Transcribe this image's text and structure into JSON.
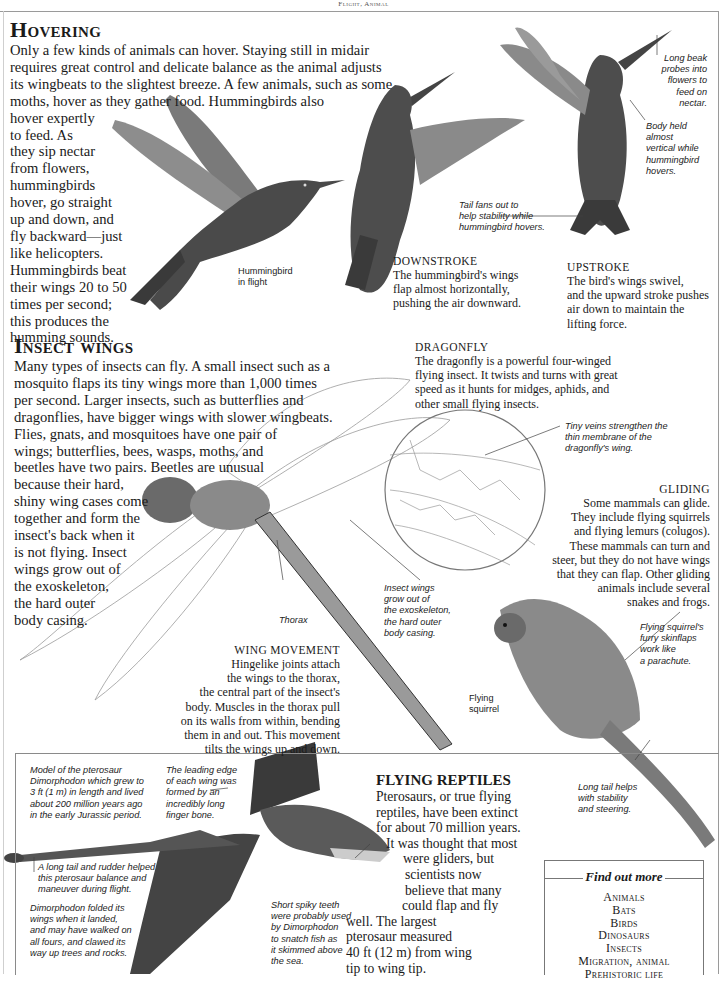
{
  "running_head": "Flight, Animal",
  "hovering": {
    "title": "Hovering",
    "intro_lines": [
      "Only a few kinds of animals can hover. Staying still in midair",
      "requires great control and delicate balance as the animal adjusts",
      "its wingbeats to the slightest breeze. A few animals, such as some",
      "moths, hover as they gather food. Hummingbirds also"
    ],
    "column_lines": [
      "hover expertly",
      "to feed. As",
      "they sip nectar",
      "from flowers,",
      "hummingbirds",
      "hover, go straight",
      "up and down, and",
      "fly backward—just",
      "like helicopters.",
      "Hummingbirds beat",
      "their wings 20 to 50",
      "times per second;",
      "this produces the",
      "humming sounds."
    ],
    "caption_in_flight": [
      "Hummingbird",
      "in flight"
    ],
    "downstroke": {
      "heading": "Downstroke",
      "lines": [
        "The hummingbird's wings",
        "flap almost horizontally,",
        "pushing the air downward."
      ]
    },
    "upstroke": {
      "heading": "Upstroke",
      "lines": [
        "The bird's wings swivel,",
        "and the upward stroke pushes",
        "air down to maintain the",
        "lifting force."
      ]
    },
    "caption_tail": [
      "Tail fans out to",
      "help stability while",
      "hummingbird hovers."
    ],
    "caption_beak": [
      "Long beak",
      "probes into",
      "flowers to",
      "feed on",
      "nectar."
    ],
    "caption_body": [
      "Body held",
      "almost",
      "vertical while",
      "hummingbird",
      "hovers."
    ]
  },
  "insect_wings": {
    "title": "Insect wings",
    "wide_lines": [
      "Many types of insects can fly. A small insect such as a",
      "mosquito flaps its tiny wings more than 1,000 times",
      "per second. Larger insects, such as butterflies and",
      "dragonflies, have bigger wings with slower wingbeats.",
      "Flies, gnats, and mosquitoes have one pair of",
      "wings; butterflies, bees, wasps, moths, and",
      "beetles have two pairs. Beetles are unusual"
    ],
    "narrow_lines": [
      "because their hard,",
      "shiny wing cases come",
      "together and form the",
      "insect's back when it",
      "is not flying. Insect",
      "wings grow out of",
      "the exoskeleton,",
      "the hard outer",
      "body casing."
    ],
    "dragonfly": {
      "heading": "Dragonfly",
      "lines": [
        "The dragonfly is a powerful four-winged",
        "flying insect. It twists and turns with great",
        "speed as it hunts for midges, aphids, and",
        "other small flying insects."
      ]
    },
    "caption_veins": [
      "Tiny veins strengthen the",
      "thin membrane of the",
      "dragonfly's wing."
    ],
    "caption_exoskeleton": [
      "Insect wings",
      "grow out of",
      "the exoskeleton,",
      "the hard outer",
      "body casing."
    ],
    "caption_thorax": "Thorax",
    "wing_movement": {
      "heading": "Wing movement",
      "lines": [
        "Hingelike joints attach",
        "the wings to the thorax,",
        "the central part of the insect's",
        "body. Muscles in the thorax pull",
        "on its walls from within, bending",
        "them in and out. This movement",
        "tilts the wings up and down."
      ]
    }
  },
  "gliding": {
    "heading": "Gliding",
    "lines": [
      "Some mammals can glide.",
      "They include flying squirrels",
      "and flying lemurs (colugos).",
      "These mammals can turn and",
      "steer, but they do not have wings",
      "that they can flap. Other gliding",
      "animals include several",
      "snakes and frogs."
    ],
    "caption_skinflaps": [
      "Flying squirrel's",
      "furry skinflaps",
      "work like",
      "a parachute."
    ],
    "caption_squirrel": [
      "Flying",
      "squirrel"
    ],
    "caption_tail": [
      "Long tail helps",
      "with stability",
      "and steering."
    ]
  },
  "pterosaur": {
    "caption_model": [
      "Model of the pterosaur",
      "Dimorphodon which grew to",
      "3 ft (1 m) in length and lived",
      "about 200 million years ago",
      "in the early Jurassic period."
    ],
    "caption_leading_edge": [
      "The leading edge",
      "of each wing was",
      "formed by an",
      "incredibly long",
      "finger bone."
    ],
    "caption_tail": [
      "A long tail and rudder helped",
      "this pterosaur balance and",
      "maneuver during flight."
    ],
    "caption_folded": [
      "Dimorphodon folded its",
      "wings when it landed,",
      "and may have walked on",
      "all fours, and clawed its",
      "way up trees and rocks."
    ],
    "caption_teeth": [
      "Short spiky teeth",
      "were probably used",
      "by Dimorphodon",
      "to snatch fish as",
      "it skimmed above",
      "the sea."
    ]
  },
  "flying_reptiles": {
    "title": "FLYING REPTILES",
    "lines": [
      "Pterosaurs, or true flying",
      "reptiles, have been extinct",
      "for about 70 million years.",
      "It was thought that most",
      "were gliders, but",
      "scientists now",
      "believe that many",
      "could flap and fly",
      "well. The largest",
      "pterosaur measured",
      "40 ft (12 m) from wing",
      "tip to wing tip."
    ]
  },
  "find_out_more": {
    "title": "Find out more",
    "items": [
      "Animals",
      "Bats",
      "Birds",
      "Dinosaurs",
      "Insects",
      "Migration, animal",
      "Prehistoric life"
    ]
  }
}
